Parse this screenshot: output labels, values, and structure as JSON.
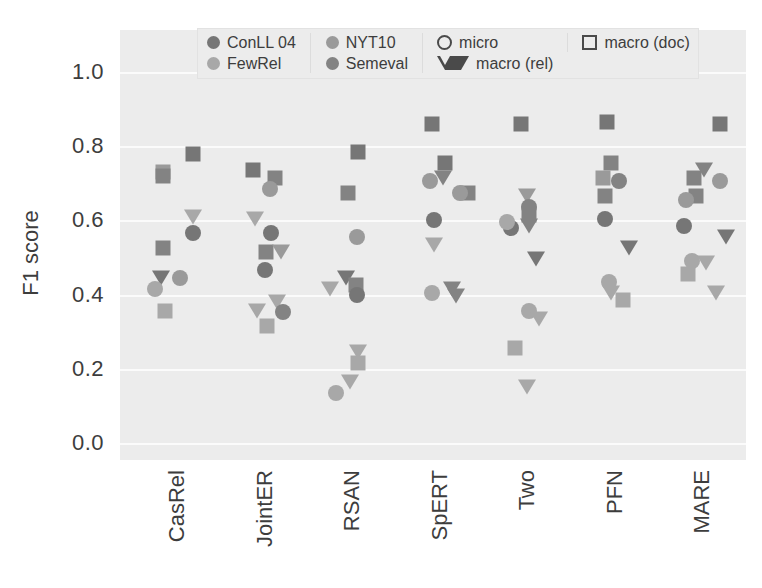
{
  "figure": {
    "ylabel": "F1 score",
    "yticks": [
      "1.0",
      "0.8",
      "0.6",
      "0.4",
      "0.2",
      "0.0"
    ],
    "xticks": [
      "CasRel",
      "JointER",
      "RSAN",
      "SpERT",
      "Two",
      "PFN",
      "MARE"
    ],
    "plot_bg": "#ececec",
    "grid_color": "#fbfbfb"
  },
  "legend": {
    "columns": [
      {
        "entries": [
          {
            "label": "ConLL 04",
            "marker": "circle",
            "color": "#767676",
            "icon": "filled-circle-icon"
          },
          {
            "label": "FewRel",
            "marker": "circle",
            "color": "#a8a8a8",
            "icon": "filled-circle-icon"
          }
        ]
      },
      {
        "entries": [
          {
            "label": "NYT10",
            "marker": "circle",
            "color": "#9a9a9a",
            "icon": "filled-circle-icon"
          },
          {
            "label": "Semeval",
            "marker": "circle",
            "color": "#838383",
            "icon": "filled-circle-icon"
          }
        ]
      },
      {
        "entries": [
          {
            "label": "micro",
            "marker": "circle-open",
            "color": "#4a4a4a",
            "icon": "open-circle-icon"
          },
          {
            "label": "macro (rel)",
            "marker": "triangle-open",
            "color": "#4a4a4a",
            "icon": "open-triangle-down-icon"
          }
        ]
      },
      {
        "entries": [
          {
            "label": "macro (doc)",
            "marker": "square-open",
            "color": "#4a4a4a",
            "icon": "open-square-icon"
          }
        ]
      }
    ]
  },
  "chart_data": {
    "type": "scatter",
    "title": "",
    "xlabel": "",
    "ylabel": "F1 score",
    "ylim": [
      0.0,
      1.0
    ],
    "ytick_values": [
      0.0,
      0.2,
      0.4,
      0.6,
      0.8,
      1.0
    ],
    "grid": true,
    "legend_position": "top",
    "categories": [
      "CasRel",
      "JointER",
      "RSAN",
      "SpERT",
      "Two",
      "PFN",
      "MARE"
    ],
    "datasets": [
      {
        "name": "ConLL 04",
        "color": "#767676"
      },
      {
        "name": "FewRel",
        "color": "#a8a8a8"
      },
      {
        "name": "NYT10",
        "color": "#9a9a9a"
      },
      {
        "name": "Semeval",
        "color": "#838383"
      }
    ],
    "metrics": [
      {
        "name": "micro",
        "marker": "circle"
      },
      {
        "name": "macro (rel)",
        "marker": "triangle-down"
      },
      {
        "name": "macro (doc)",
        "marker": "square"
      }
    ],
    "points": [
      {
        "model": "CasRel",
        "dataset": "NYT10",
        "metric": "macro (doc)",
        "value": 0.73,
        "dx": -12
      },
      {
        "model": "CasRel",
        "dataset": "Semeval",
        "metric": "macro (doc)",
        "value": 0.72,
        "dx": -12
      },
      {
        "model": "CasRel",
        "dataset": "ConLL 04",
        "metric": "macro (doc)",
        "value": 0.78,
        "dx": 18
      },
      {
        "model": "CasRel",
        "dataset": "FewRel",
        "metric": "macro (rel)",
        "value": 0.61,
        "dx": 18
      },
      {
        "model": "CasRel",
        "dataset": "ConLL 04",
        "metric": "micro",
        "value": 0.565,
        "dx": 18
      },
      {
        "model": "CasRel",
        "dataset": "Semeval",
        "metric": "macro (doc)",
        "value": 0.525,
        "dx": -12
      },
      {
        "model": "CasRel",
        "dataset": "ConLL 04",
        "metric": "macro (rel)",
        "value": 0.445,
        "dx": -14
      },
      {
        "model": "CasRel",
        "dataset": "NYT10",
        "metric": "micro",
        "value": 0.445,
        "dx": 5
      },
      {
        "model": "CasRel",
        "dataset": "FewRel",
        "metric": "micro",
        "value": 0.415,
        "dx": -20
      },
      {
        "model": "CasRel",
        "dataset": "FewRel",
        "metric": "macro (doc)",
        "value": 0.355,
        "dx": -10
      },
      {
        "model": "JointER",
        "dataset": "ConLL 04",
        "metric": "macro (doc)",
        "value": 0.735,
        "dx": -10
      },
      {
        "model": "JointER",
        "dataset": "Semeval",
        "metric": "macro (doc)",
        "value": 0.715,
        "dx": 12
      },
      {
        "model": "JointER",
        "dataset": "NYT10",
        "metric": "micro",
        "value": 0.685,
        "dx": 7
      },
      {
        "model": "JointER",
        "dataset": "FewRel",
        "metric": "macro (rel)",
        "value": 0.605,
        "dx": -8
      },
      {
        "model": "JointER",
        "dataset": "ConLL 04",
        "metric": "micro",
        "value": 0.565,
        "dx": 8
      },
      {
        "model": "JointER",
        "dataset": "Semeval",
        "metric": "macro (doc)",
        "value": 0.515,
        "dx": 3
      },
      {
        "model": "JointER",
        "dataset": "NYT10",
        "metric": "macro (rel)",
        "value": 0.515,
        "dx": 18
      },
      {
        "model": "JointER",
        "dataset": "ConLL 04",
        "metric": "micro",
        "value": 0.465,
        "dx": 2
      },
      {
        "model": "JointER",
        "dataset": "FewRel",
        "metric": "macro (rel)",
        "value": 0.38,
        "dx": 14
      },
      {
        "model": "JointER",
        "dataset": "FewRel",
        "metric": "macro (rel)",
        "value": 0.355,
        "dx": -6
      },
      {
        "model": "JointER",
        "dataset": "Semeval",
        "metric": "micro",
        "value": 0.352,
        "dx": 20
      },
      {
        "model": "JointER",
        "dataset": "FewRel",
        "metric": "macro (doc)",
        "value": 0.315,
        "dx": 4
      },
      {
        "model": "RSAN",
        "dataset": "ConLL 04",
        "metric": "macro (doc)",
        "value": 0.785,
        "dx": 8
      },
      {
        "model": "RSAN",
        "dataset": "Semeval",
        "metric": "macro (doc)",
        "value": 0.675,
        "dx": -2
      },
      {
        "model": "RSAN",
        "dataset": "NYT10",
        "metric": "micro",
        "value": 0.555,
        "dx": 7
      },
      {
        "model": "RSAN",
        "dataset": "ConLL 04",
        "metric": "macro (rel)",
        "value": 0.445,
        "dx": -4
      },
      {
        "model": "RSAN",
        "dataset": "Semeval",
        "metric": "macro (doc)",
        "value": 0.425,
        "dx": 6
      },
      {
        "model": "RSAN",
        "dataset": "FewRel",
        "metric": "macro (rel)",
        "value": 0.415,
        "dx": -20
      },
      {
        "model": "RSAN",
        "dataset": "ConLL 04",
        "metric": "micro",
        "value": 0.4,
        "dx": 7
      },
      {
        "model": "RSAN",
        "dataset": "FewRel",
        "metric": "macro (rel)",
        "value": 0.245,
        "dx": 8
      },
      {
        "model": "RSAN",
        "dataset": "FewRel",
        "metric": "macro (doc)",
        "value": 0.215,
        "dx": 8
      },
      {
        "model": "RSAN",
        "dataset": "FewRel",
        "metric": "macro (rel)",
        "value": 0.165,
        "dx": 0
      },
      {
        "model": "RSAN",
        "dataset": "FewRel",
        "metric": "micro",
        "value": 0.135,
        "dx": -14
      },
      {
        "model": "SpERT",
        "dataset": "ConLL 04",
        "metric": "macro (doc)",
        "value": 0.86,
        "dx": -6
      },
      {
        "model": "SpERT",
        "dataset": "ConLL 04",
        "metric": "macro (doc)",
        "value": 0.755,
        "dx": 7
      },
      {
        "model": "SpERT",
        "dataset": "Semeval",
        "metric": "macro (rel)",
        "value": 0.715,
        "dx": 5
      },
      {
        "model": "SpERT",
        "dataset": "NYT10",
        "metric": "micro",
        "value": 0.705,
        "dx": -8
      },
      {
        "model": "SpERT",
        "dataset": "Semeval",
        "metric": "macro (doc)",
        "value": 0.675,
        "dx": 30
      },
      {
        "model": "SpERT",
        "dataset": "NYT10",
        "metric": "micro",
        "value": 0.675,
        "dx": 22
      },
      {
        "model": "SpERT",
        "dataset": "ConLL 04",
        "metric": "micro",
        "value": 0.6,
        "dx": -4
      },
      {
        "model": "SpERT",
        "dataset": "FewRel",
        "metric": "macro (rel)",
        "value": 0.535,
        "dx": -4
      },
      {
        "model": "SpERT",
        "dataset": "FewRel",
        "metric": "micro",
        "value": 0.405,
        "dx": -6
      },
      {
        "model": "SpERT",
        "dataset": "Semeval",
        "metric": "macro (rel)",
        "value": 0.415,
        "dx": 14
      },
      {
        "model": "SpERT",
        "dataset": "Semeval",
        "metric": "macro (rel)",
        "value": 0.395,
        "dx": 18
      },
      {
        "model": "Two",
        "dataset": "ConLL 04",
        "metric": "macro (doc)",
        "value": 0.86,
        "dx": -4
      },
      {
        "model": "Two",
        "dataset": "NYT10",
        "metric": "macro (rel)",
        "value": 0.665,
        "dx": 2
      },
      {
        "model": "Two",
        "dataset": "Semeval",
        "metric": "micro",
        "value": 0.635,
        "dx": 4
      },
      {
        "model": "Two",
        "dataset": "Semeval",
        "metric": "macro (doc)",
        "value": 0.615,
        "dx": 4
      },
      {
        "model": "Two",
        "dataset": "ConLL 04",
        "metric": "micro",
        "value": 0.58,
        "dx": -14
      },
      {
        "model": "Two",
        "dataset": "FewRel",
        "metric": "micro",
        "value": 0.595,
        "dx": -18
      },
      {
        "model": "Two",
        "dataset": "Semeval",
        "metric": "macro (rel)",
        "value": 0.585,
        "dx": 4
      },
      {
        "model": "Two",
        "dataset": "ConLL 04",
        "metric": "macro (rel)",
        "value": 0.495,
        "dx": 11
      },
      {
        "model": "Two",
        "dataset": "FewRel",
        "metric": "micro",
        "value": 0.355,
        "dx": 4
      },
      {
        "model": "Two",
        "dataset": "FewRel",
        "metric": "macro (rel)",
        "value": 0.335,
        "dx": 14
      },
      {
        "model": "Two",
        "dataset": "FewRel",
        "metric": "macro (doc)",
        "value": 0.255,
        "dx": -10
      },
      {
        "model": "Two",
        "dataset": "FewRel",
        "metric": "macro (rel)",
        "value": 0.15,
        "dx": 2
      },
      {
        "model": "PFN",
        "dataset": "ConLL 04",
        "metric": "macro (doc)",
        "value": 0.865,
        "dx": -6
      },
      {
        "model": "PFN",
        "dataset": "Semeval",
        "metric": "macro (doc)",
        "value": 0.755,
        "dx": -2
      },
      {
        "model": "PFN",
        "dataset": "NYT10",
        "metric": "macro (doc)",
        "value": 0.715,
        "dx": -10
      },
      {
        "model": "PFN",
        "dataset": "Semeval",
        "metric": "micro",
        "value": 0.705,
        "dx": 6
      },
      {
        "model": "PFN",
        "dataset": "Semeval",
        "metric": "macro (doc)",
        "value": 0.665,
        "dx": -8
      },
      {
        "model": "PFN",
        "dataset": "ConLL 04",
        "metric": "micro",
        "value": 0.605,
        "dx": -8
      },
      {
        "model": "PFN",
        "dataset": "ConLL 04",
        "metric": "macro (rel)",
        "value": 0.525,
        "dx": 16
      },
      {
        "model": "PFN",
        "dataset": "FewRel",
        "metric": "micro",
        "value": 0.435,
        "dx": -4
      },
      {
        "model": "PFN",
        "dataset": "FewRel",
        "metric": "macro (rel)",
        "value": 0.405,
        "dx": -2
      },
      {
        "model": "PFN",
        "dataset": "FewRel",
        "metric": "macro (doc)",
        "value": 0.385,
        "dx": 10
      },
      {
        "model": "MARE",
        "dataset": "ConLL 04",
        "metric": "macro (doc)",
        "value": 0.86,
        "dx": 20
      },
      {
        "model": "MARE",
        "dataset": "Semeval",
        "metric": "macro (rel)",
        "value": 0.735,
        "dx": 4
      },
      {
        "model": "MARE",
        "dataset": "Semeval",
        "metric": "macro (doc)",
        "value": 0.715,
        "dx": -6
      },
      {
        "model": "MARE",
        "dataset": "NYT10",
        "metric": "micro",
        "value": 0.705,
        "dx": 20
      },
      {
        "model": "MARE",
        "dataset": "Semeval",
        "metric": "macro (doc)",
        "value": 0.665,
        "dx": -4
      },
      {
        "model": "MARE",
        "dataset": "NYT10",
        "metric": "micro",
        "value": 0.655,
        "dx": -14
      },
      {
        "model": "MARE",
        "dataset": "ConLL 04",
        "metric": "micro",
        "value": 0.585,
        "dx": -16
      },
      {
        "model": "MARE",
        "dataset": "ConLL 04",
        "metric": "macro (rel)",
        "value": 0.555,
        "dx": 26
      },
      {
        "model": "MARE",
        "dataset": "FewRel",
        "metric": "micro",
        "value": 0.49,
        "dx": -8
      },
      {
        "model": "MARE",
        "dataset": "FewRel",
        "metric": "macro (rel)",
        "value": 0.485,
        "dx": 6
      },
      {
        "model": "MARE",
        "dataset": "FewRel",
        "metric": "macro (doc)",
        "value": 0.455,
        "dx": -12
      },
      {
        "model": "MARE",
        "dataset": "FewRel",
        "metric": "macro (rel)",
        "value": 0.405,
        "dx": 16
      }
    ]
  }
}
